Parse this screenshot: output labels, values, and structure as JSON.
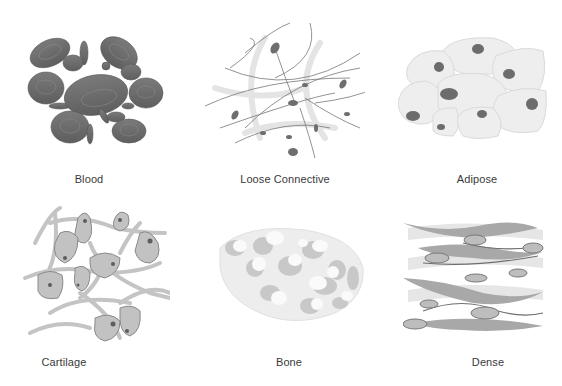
{
  "diagram": {
    "type": "connective-tissue-types",
    "colors": {
      "background": "#ffffff",
      "dark_gray": "#6b6b6b",
      "mid_gray": "#9a9a9a",
      "light_gray": "#c8c8c8",
      "pale_gray": "#ececec",
      "label_text": "#3a3a3a"
    },
    "panels": [
      {
        "id": "blood",
        "label": "Blood",
        "icon": "red-blood-cells"
      },
      {
        "id": "loose",
        "label": "Loose Connective",
        "icon": "fibers-with-fibroblasts"
      },
      {
        "id": "adipose",
        "label": "Adipose",
        "icon": "fat-cells"
      },
      {
        "id": "cartilage",
        "label": "Cartilage",
        "icon": "chondrocytes-in-matrix"
      },
      {
        "id": "bone",
        "label": "Bone",
        "icon": "spongy-bone"
      },
      {
        "id": "dense",
        "label": "Dense",
        "icon": "parallel-collagen-fibers"
      }
    ]
  }
}
